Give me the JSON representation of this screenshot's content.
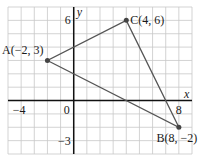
{
  "diagram": {
    "type": "coordinate-plane-triangle",
    "x_range": [
      -5,
      9
    ],
    "y_range": [
      -4,
      7
    ],
    "axis_labels": {
      "x": "x",
      "y": "y"
    },
    "tick_labels": [
      {
        "axis": "x",
        "value": -4,
        "text": "−4"
      },
      {
        "axis": "x",
        "value": 0,
        "text": "0"
      },
      {
        "axis": "x",
        "value": 8,
        "text": "8"
      },
      {
        "axis": "y",
        "value": 6,
        "text": "6"
      },
      {
        "axis": "y",
        "value": -3,
        "text": "−3"
      }
    ],
    "points": [
      {
        "id": "A",
        "x": -2,
        "y": 3,
        "label": "A(−2, 3)"
      },
      {
        "id": "B",
        "x": 8,
        "y": -2,
        "label": "B(8, −2)"
      },
      {
        "id": "C",
        "x": 4,
        "y": 6,
        "label": "C(4, 6)"
      }
    ],
    "colors": {
      "grid": "#c8c8c8",
      "axis": "#111111",
      "edge": "#555555",
      "point": "#444444"
    }
  }
}
